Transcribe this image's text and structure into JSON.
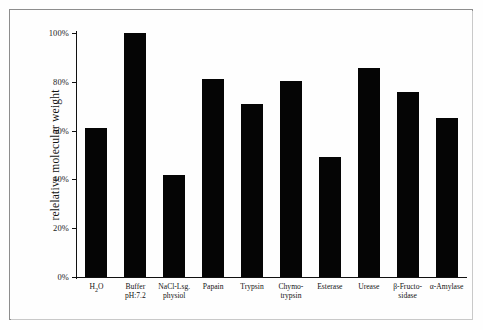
{
  "chart_data": {
    "type": "bar",
    "title": "",
    "xlabel": "",
    "ylabel": "relelative molecular weight",
    "ylim": [
      0,
      100
    ],
    "grid": false,
    "legend": null,
    "yticks": [
      "0%",
      "20%",
      "40%",
      "60%",
      "80%",
      "100%"
    ],
    "ytick_values": [
      0,
      20,
      40,
      60,
      80,
      100
    ],
    "categories": [
      "H₂O",
      "Buffer pH:7.2",
      "NaCl-Lsg. physiol",
      "Papain",
      "Trypsin",
      "Chymo-trypsin",
      "Esterase",
      "Urease",
      "β-Fructo-sidase",
      "α-Amylase"
    ],
    "category_lines": [
      [
        "H₂O",
        ""
      ],
      [
        "Buffer",
        "pH:7.2"
      ],
      [
        "NaCl-Lsg.",
        "physiol"
      ],
      [
        "Papain",
        ""
      ],
      [
        "Trypsin",
        ""
      ],
      [
        "Chymo-",
        "trypsin"
      ],
      [
        "Esterase",
        ""
      ],
      [
        "Urease",
        ""
      ],
      [
        "β-Fructo-",
        "sidase"
      ],
      [
        "α-Amylase",
        ""
      ]
    ],
    "values": [
      61,
      100,
      42,
      81,
      71,
      80.5,
      49,
      85.5,
      76,
      65
    ],
    "bar_color": "#050505",
    "axis_color": "#111111",
    "background_color": "#fefefe",
    "frame_color": "#8d8d8d"
  }
}
